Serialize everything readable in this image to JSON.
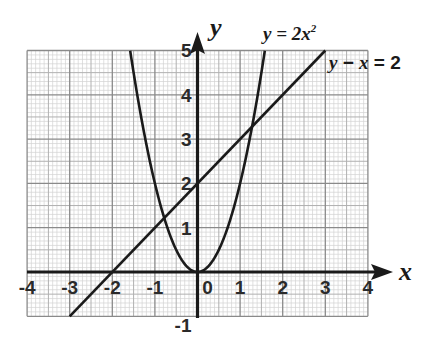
{
  "chart_data": {
    "type": "line",
    "title": "",
    "xlabel": "x",
    "ylabel": "y",
    "xlim": [
      -4,
      4
    ],
    "ylim": [
      -1,
      5
    ],
    "grid": true,
    "grid_minor_per_unit": 10,
    "x_ticks": [
      "-4",
      "-3",
      "-2",
      "-1",
      "0",
      "1",
      "2",
      "3",
      "4"
    ],
    "y_ticks": [
      "-1",
      "1",
      "2",
      "3",
      "4",
      "5"
    ],
    "series": [
      {
        "name": "y = 2x²",
        "label_prefix": "y = 2",
        "label_var": "x",
        "label_sup": "2",
        "equation": "y = 2x^2",
        "x": [
          -1.58,
          -1.5,
          -1.25,
          -1,
          -0.75,
          -0.5,
          -0.25,
          0,
          0.25,
          0.5,
          0.75,
          1,
          1.25,
          1.5,
          1.58
        ],
        "y": [
          5,
          4.5,
          3.125,
          2,
          1.125,
          0.5,
          0.125,
          0,
          0.125,
          0.5,
          1.125,
          2,
          3.125,
          4.5,
          5
        ]
      },
      {
        "name": "y − x = 2",
        "label_prefix": "y − ",
        "label_var": "x",
        "label_suffix": " = 2",
        "equation": "y = x + 2",
        "x": [
          -3,
          3
        ],
        "y": [
          -1,
          5
        ]
      }
    ],
    "intersections": [
      [
        -0.78,
        1.22
      ],
      [
        1.28,
        3.28
      ]
    ],
    "legend_position": "inline annotations top-right"
  },
  "labels": {
    "x_axis": "x",
    "y_axis": "y",
    "curve_prefix": "y = 2",
    "curve_var": "x",
    "curve_sup": "2",
    "line_lhs_y": "y",
    "line_op": " − ",
    "line_var": "x",
    "line_rhs": " = 2"
  }
}
